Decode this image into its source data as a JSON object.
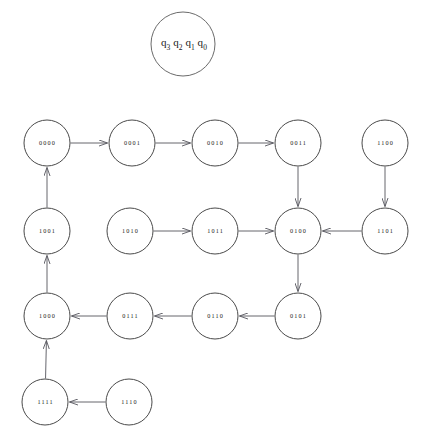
{
  "diagram": {
    "type": "state-transition-graph",
    "title": "",
    "background_color": "#ffffff",
    "node_stroke_color": "#4a4a4a",
    "edge_color": "#55555c",
    "label_color": "#1a1a1a",
    "node_radius": 23,
    "legend": {
      "name": "state-bit-legend",
      "center_x": 183,
      "center_y": 44,
      "radius": 32,
      "parts": [
        {
          "base": "q",
          "sub": "3"
        },
        {
          "base": "q",
          "sub": "2"
        },
        {
          "base": "q",
          "sub": "1"
        },
        {
          "base": "q",
          "sub": "0"
        }
      ],
      "text": "q3q2q1q0"
    },
    "nodes": [
      {
        "id": "0000",
        "label": "0000",
        "x": 47,
        "y": 143
      },
      {
        "id": "0001",
        "label": "0001",
        "x": 132,
        "y": 143
      },
      {
        "id": "0010",
        "label": "0010",
        "x": 215,
        "y": 143
      },
      {
        "id": "0011",
        "label": "0011",
        "x": 298,
        "y": 143
      },
      {
        "id": "1100",
        "label": "1100",
        "x": 385,
        "y": 143
      },
      {
        "id": "1001",
        "label": "1001",
        "x": 47,
        "y": 231
      },
      {
        "id": "1010",
        "label": "1010",
        "x": 130,
        "y": 231
      },
      {
        "id": "1011",
        "label": "1011",
        "x": 215,
        "y": 231
      },
      {
        "id": "0100",
        "label": "0100",
        "x": 298,
        "y": 231
      },
      {
        "id": "1101",
        "label": "1101",
        "x": 385,
        "y": 231
      },
      {
        "id": "1000",
        "label": "1000",
        "x": 47,
        "y": 316
      },
      {
        "id": "0111",
        "label": "0111",
        "x": 130,
        "y": 316
      },
      {
        "id": "0110",
        "label": "0110",
        "x": 215,
        "y": 316
      },
      {
        "id": "0101",
        "label": "0101",
        "x": 298,
        "y": 316
      },
      {
        "id": "1111",
        "label": "1111",
        "x": 45,
        "y": 402
      },
      {
        "id": "1110",
        "label": "1110",
        "x": 129,
        "y": 402
      }
    ],
    "edges": [
      {
        "from": "0000",
        "to": "0001"
      },
      {
        "from": "0001",
        "to": "0010"
      },
      {
        "from": "0010",
        "to": "0011"
      },
      {
        "from": "0011",
        "to": "0100"
      },
      {
        "from": "0100",
        "to": "0101"
      },
      {
        "from": "0101",
        "to": "0110"
      },
      {
        "from": "0110",
        "to": "0111"
      },
      {
        "from": "0111",
        "to": "1000"
      },
      {
        "from": "1000",
        "to": "1001"
      },
      {
        "from": "1001",
        "to": "0000"
      },
      {
        "from": "1010",
        "to": "1011"
      },
      {
        "from": "1011",
        "to": "0100"
      },
      {
        "from": "1100",
        "to": "1101"
      },
      {
        "from": "1101",
        "to": "0100"
      },
      {
        "from": "1110",
        "to": "1111"
      },
      {
        "from": "1111",
        "to": "1000"
      }
    ]
  }
}
